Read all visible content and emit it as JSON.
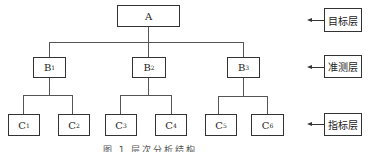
{
  "diagram": {
    "root": {
      "label": "A"
    },
    "criteria": [
      {
        "label": "B",
        "sub": "1"
      },
      {
        "label": "B",
        "sub": "2"
      },
      {
        "label": "B",
        "sub": "3"
      }
    ],
    "indicators": [
      {
        "label": "C",
        "sub": "1"
      },
      {
        "label": "C",
        "sub": "2"
      },
      {
        "label": "C",
        "sub": "3"
      },
      {
        "label": "C",
        "sub": "4"
      },
      {
        "label": "C",
        "sub": "5"
      },
      {
        "label": "C",
        "sub": "6"
      }
    ],
    "layers": [
      {
        "label": "目标层"
      },
      {
        "label": "准测层"
      },
      {
        "label": "指标层"
      }
    ],
    "caption": "图 1  层次分析结构"
  }
}
